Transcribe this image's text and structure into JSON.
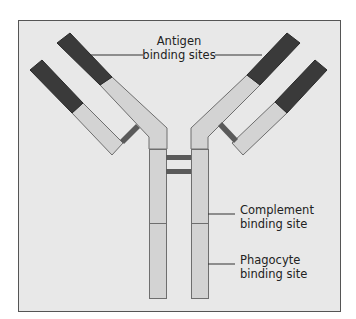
{
  "diagram": {
    "colors": {
      "page_bg": "#ffffff",
      "panel_bg": "#e8e8e8",
      "panel_border": "#555555",
      "constant_fill": "#d3d3d3",
      "chain_outline": "#6e6e6e",
      "variable_fill": "#3a3a3a",
      "variable_outline": "#2a2a2a",
      "disulfide_fill": "#5a5a5a",
      "leader_line": "#333333",
      "text": "#222222"
    },
    "labels": {
      "antigen": {
        "line1": "Antigen",
        "line2": "binding sites"
      },
      "complement": {
        "line1": "Complement",
        "line2": "binding site"
      },
      "phagocyte": {
        "line1": "Phagocyte",
        "line2": "binding site"
      }
    },
    "components": [
      "heavy-chain-left",
      "heavy-chain-right",
      "light-chain-left",
      "light-chain-right",
      "variable-region-left-heavy",
      "variable-region-left-light",
      "variable-region-right-heavy",
      "variable-region-right-light",
      "disulfide-bond-interchain-left",
      "disulfide-bond-interchain-right",
      "disulfide-bond-hinge-upper",
      "disulfide-bond-hinge-lower",
      "stem-left",
      "stem-right"
    ]
  }
}
